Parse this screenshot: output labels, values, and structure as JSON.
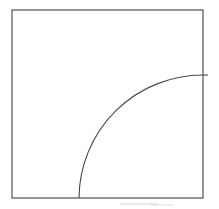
{
  "figure": {
    "title": "Square with inscribed quarter circle arc",
    "canvas": {
      "width": 219,
      "height": 209,
      "background_color": "#ffffff"
    },
    "stroke": {
      "color": "#4a4a4a",
      "width": 1.15
    },
    "square": {
      "name": "outer square",
      "left": 12,
      "top": 10,
      "right": 203,
      "bottom": 198,
      "width": 191,
      "height": 188
    },
    "arc": {
      "name": "quarter circle arc",
      "center_x": 203,
      "center_y": 198,
      "radius": 124,
      "start_x": 79,
      "start_y": 198,
      "end_x": 203,
      "end_y": 75,
      "sweep_degrees": 90
    },
    "tick": {
      "name": "right edge tick",
      "x1": 203,
      "y1": 75,
      "x2": 208,
      "y2": 75
    },
    "smudges": [
      {
        "x": 120,
        "y": 203,
        "width": 38,
        "height": 2
      },
      {
        "x": 150,
        "y": 204,
        "width": 24,
        "height": 2
      }
    ]
  }
}
